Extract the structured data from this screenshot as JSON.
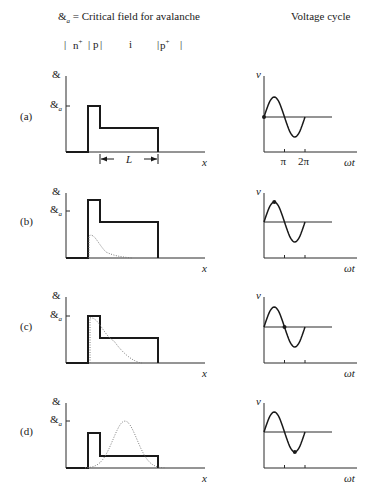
{
  "header": {
    "legend_symbol": "&",
    "legend_subscript": "a",
    "legend_text": " = Critical field for avalanche",
    "right_title": "Voltage cycle",
    "regions": [
      {
        "label": "n",
        "sup": "+"
      },
      {
        "label": "p",
        "sup": ""
      },
      {
        "label": "i",
        "sup": ""
      },
      {
        "label": "p",
        "sup": "+"
      }
    ]
  },
  "axis_labels": {
    "field_symbol": "&",
    "critical_symbol": "&",
    "critical_subscript": "a",
    "x_label": "x",
    "v_label": "v",
    "t_label": "ωt",
    "pi_label": "π",
    "two_pi_label": "2π",
    "length_label": "L"
  },
  "panels": [
    {
      "id": "a",
      "label": "(a)",
      "top": 70,
      "ea_y": 106,
      "step_top": 106,
      "plateau": 128,
      "base": 152,
      "carrier": "none",
      "dot_phase": 0,
      "show_L": true,
      "show_pi": true
    },
    {
      "id": "b",
      "label": "(b)",
      "top": 187,
      "ea_y": 211,
      "step_top": 200,
      "plateau": 222,
      "base": 258,
      "carrier": "small",
      "dot_phase": 0.25,
      "show_L": false,
      "show_pi": false
    },
    {
      "id": "c",
      "label": "(c)",
      "top": 291,
      "ea_y": 316,
      "step_top": 316,
      "plateau": 338,
      "base": 363,
      "carrier": "wide",
      "dot_phase": 0.5,
      "show_L": false,
      "show_pi": false
    },
    {
      "id": "d",
      "label": "(d)",
      "top": 397,
      "ea_y": 421,
      "step_top": 433,
      "plateau": 456,
      "base": 468,
      "carrier": "gauss",
      "dot_phase": 0.75,
      "show_L": false,
      "show_pi": false
    }
  ],
  "colors": {
    "ink": "#1a1a1a",
    "dotted": "#7a7a7a",
    "axis": "#2a2a2a"
  }
}
